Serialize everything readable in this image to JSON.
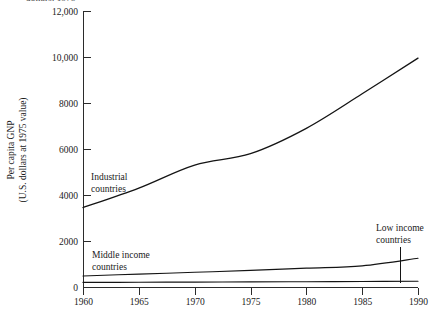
{
  "figure": {
    "clipped_header_text": "dollars, 1975",
    "plot_area": {
      "x0": 83,
      "x1": 418,
      "y0": 11,
      "y1": 287
    }
  },
  "chart_data": {
    "type": "line",
    "title": "",
    "xlabel": "",
    "ylabel": "Per capita GNP (U.S. dollars at 1975 value)",
    "ylabel_line1": "Per capita GNP",
    "ylabel_line2": "(U.S. dollars at 1975 value)",
    "x": [
      1960,
      1965,
      1970,
      1975,
      1980,
      1985,
      1990
    ],
    "xlim": [
      1960,
      1990
    ],
    "ylim": [
      0,
      12000
    ],
    "grid": false,
    "legend_position": "inline-annotations",
    "xtick_labels": [
      "1960",
      "1965",
      "1970",
      "1975",
      "1980",
      "1985",
      "1990"
    ],
    "ytick_values": [
      0,
      2000,
      4000,
      6000,
      8000,
      10000,
      12000
    ],
    "ytick_labels": [
      "0",
      "2000",
      "4000",
      "6000",
      "8000",
      "10,000",
      "12,000"
    ],
    "series": [
      {
        "name": "Industrial countries",
        "label_line1": "Industrial",
        "label_line2": "countries",
        "values": [
          3450,
          4300,
          5300,
          5800,
          6900,
          8400,
          9950
        ]
      },
      {
        "name": "Middle income countries",
        "label_line1": "Middle income",
        "label_line2": "countries",
        "values": [
          480,
          560,
          640,
          720,
          820,
          920,
          1250
        ]
      },
      {
        "name": "Low income countries",
        "label_line1": "Low income",
        "label_line2": "countries",
        "values": [
          200,
          205,
          215,
          220,
          230,
          240,
          250
        ]
      }
    ],
    "annotations": [
      {
        "text": "Industrial countries",
        "x": 1965,
        "y": 4100
      },
      {
        "text": "Middle income countries",
        "x": 1961,
        "y": 1450
      },
      {
        "text": "Low income countries",
        "x": 1987,
        "y": 2050
      }
    ]
  }
}
